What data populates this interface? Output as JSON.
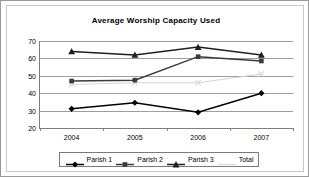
{
  "chart_data": {
    "type": "line",
    "title": "Average Worship Capacity Used",
    "xlabel": "",
    "ylabel": "",
    "categories": [
      "2004",
      "2005",
      "2006",
      "2007"
    ],
    "ylim": [
      20,
      70
    ],
    "yticks": [
      20,
      30,
      40,
      50,
      60,
      70
    ],
    "ytick_labels": [
      "20",
      "30",
      "40",
      "50",
      "60",
      "70"
    ],
    "grid": true,
    "legend_position": "bottom",
    "series": [
      {
        "name": "Parish 1",
        "marker": "diamond",
        "color": "#000000",
        "values": [
          31,
          34.5,
          29,
          40
        ]
      },
      {
        "name": "Parish 2",
        "marker": "square",
        "color": "#3a3a3a",
        "values": [
          47,
          47.5,
          61,
          58.5
        ]
      },
      {
        "name": "Parish 3",
        "marker": "triangle",
        "color": "#1f1f1f",
        "values": [
          64,
          62,
          66.5,
          62
        ]
      },
      {
        "name": "Total",
        "marker": "x",
        "color": "#d5d5d5",
        "values": [
          45,
          46,
          46,
          51
        ]
      }
    ]
  },
  "legend": {
    "items": [
      {
        "label": "Parish 1"
      },
      {
        "label": "Parish 2"
      },
      {
        "label": "Parish 3"
      },
      {
        "label": "Total"
      }
    ]
  },
  "colors": {
    "frame_border": "#9a9a9a",
    "plot_border": "#808080",
    "gridline": "#9e9e9e",
    "background": "#ffffff",
    "text": "#000000"
  }
}
